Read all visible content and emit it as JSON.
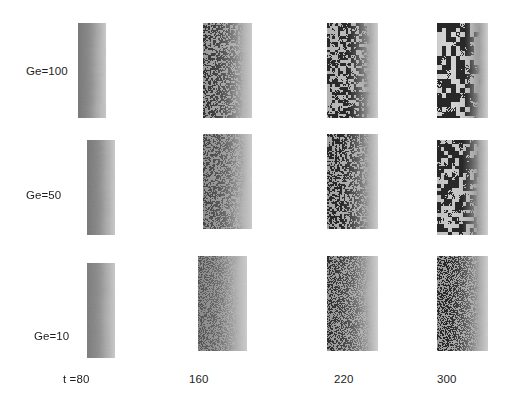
{
  "figure": {
    "type": "image-grid",
    "width": 516,
    "height": 416,
    "background": "#ffffff",
    "ink_color": "#1d1d1d"
  },
  "row_labels": [
    {
      "text": "Ge=100",
      "x": 26,
      "y": 65,
      "value": 100
    },
    {
      "text": "Ge=50",
      "x": 26,
      "y": 189,
      "value": 50
    },
    {
      "text": "Ge=10",
      "x": 34,
      "y": 330,
      "value": 10
    }
  ],
  "col_labels": [
    {
      "text": "t =80",
      "x": 63,
      "y": 373,
      "value": 80
    },
    {
      "text": "160",
      "x": 189,
      "y": 373,
      "value": 160
    },
    {
      "text": "220",
      "x": 334,
      "y": 373,
      "value": 220
    },
    {
      "text": "300",
      "x": 437,
      "y": 373,
      "value": 300
    }
  ],
  "panels": [
    {
      "name": "panel-ge100-t80",
      "row": 0,
      "col": 0,
      "ge": 100,
      "t": 80,
      "x": 78,
      "y": 23,
      "w": 28,
      "h": 95,
      "grain": 0.0,
      "noise_frac": 0.0,
      "cell_size": 1,
      "dark_edge": 0.42,
      "left_tone": 0.62,
      "right_tone": 0.3
    },
    {
      "name": "panel-ge100-t160",
      "row": 0,
      "col": 1,
      "ge": 100,
      "t": 160,
      "x": 203,
      "y": 23,
      "w": 49,
      "h": 95,
      "grain": 0.55,
      "noise_frac": 0.52,
      "cell_size": 2,
      "dark_edge": 0.4,
      "left_tone": 0.72,
      "right_tone": 0.28
    },
    {
      "name": "panel-ge100-t220",
      "row": 0,
      "col": 2,
      "ge": 100,
      "t": 220,
      "x": 327,
      "y": 23,
      "w": 51,
      "h": 95,
      "grain": 0.82,
      "noise_frac": 0.72,
      "cell_size": 3,
      "dark_edge": 0.3,
      "left_tone": 0.8,
      "right_tone": 0.26
    },
    {
      "name": "panel-ge100-t300",
      "row": 0,
      "col": 3,
      "ge": 100,
      "t": 300,
      "x": 437,
      "y": 23,
      "w": 51,
      "h": 95,
      "grain": 1.0,
      "noise_frac": 0.88,
      "cell_size": 5,
      "dark_edge": 0.16,
      "left_tone": 0.86,
      "right_tone": 0.24
    },
    {
      "name": "panel-ge50-t80",
      "row": 1,
      "col": 0,
      "ge": 50,
      "t": 80,
      "x": 87,
      "y": 140,
      "w": 28,
      "h": 95,
      "grain": 0.0,
      "noise_frac": 0.0,
      "cell_size": 1,
      "dark_edge": 0.42,
      "left_tone": 0.62,
      "right_tone": 0.3
    },
    {
      "name": "panel-ge50-t160",
      "row": 1,
      "col": 1,
      "ge": 50,
      "t": 160,
      "x": 203,
      "y": 134,
      "w": 49,
      "h": 95,
      "grain": 0.38,
      "noise_frac": 0.46,
      "cell_size": 2,
      "dark_edge": 0.42,
      "left_tone": 0.7,
      "right_tone": 0.28
    },
    {
      "name": "panel-ge50-t220",
      "row": 1,
      "col": 2,
      "ge": 50,
      "t": 220,
      "x": 327,
      "y": 134,
      "w": 51,
      "h": 95,
      "grain": 0.66,
      "noise_frac": 0.66,
      "cell_size": 2,
      "dark_edge": 0.32,
      "left_tone": 0.78,
      "right_tone": 0.26
    },
    {
      "name": "panel-ge50-t300",
      "row": 1,
      "col": 3,
      "ge": 50,
      "t": 300,
      "x": 437,
      "y": 140,
      "w": 51,
      "h": 95,
      "grain": 0.92,
      "noise_frac": 0.82,
      "cell_size": 4,
      "dark_edge": 0.2,
      "left_tone": 0.84,
      "right_tone": 0.24
    },
    {
      "name": "panel-ge10-t80",
      "row": 2,
      "col": 0,
      "ge": 10,
      "t": 80,
      "x": 87,
      "y": 263,
      "w": 28,
      "h": 95,
      "grain": 0.0,
      "noise_frac": 0.0,
      "cell_size": 1,
      "dark_edge": 0.42,
      "left_tone": 0.6,
      "right_tone": 0.3
    },
    {
      "name": "panel-ge10-t160",
      "row": 2,
      "col": 1,
      "ge": 10,
      "t": 160,
      "x": 198,
      "y": 256,
      "w": 49,
      "h": 95,
      "grain": 0.22,
      "noise_frac": 0.4,
      "cell_size": 1,
      "dark_edge": 0.44,
      "left_tone": 0.68,
      "right_tone": 0.28
    },
    {
      "name": "panel-ge10-t220",
      "row": 2,
      "col": 2,
      "ge": 10,
      "t": 220,
      "x": 327,
      "y": 256,
      "w": 51,
      "h": 95,
      "grain": 0.45,
      "noise_frac": 0.6,
      "cell_size": 1,
      "dark_edge": 0.38,
      "left_tone": 0.74,
      "right_tone": 0.26
    },
    {
      "name": "panel-ge10-t300",
      "row": 2,
      "col": 3,
      "ge": 10,
      "t": 300,
      "x": 437,
      "y": 256,
      "w": 51,
      "h": 95,
      "grain": 0.55,
      "noise_frac": 0.66,
      "cell_size": 1,
      "dark_edge": 0.34,
      "left_tone": 0.78,
      "right_tone": 0.26
    }
  ]
}
